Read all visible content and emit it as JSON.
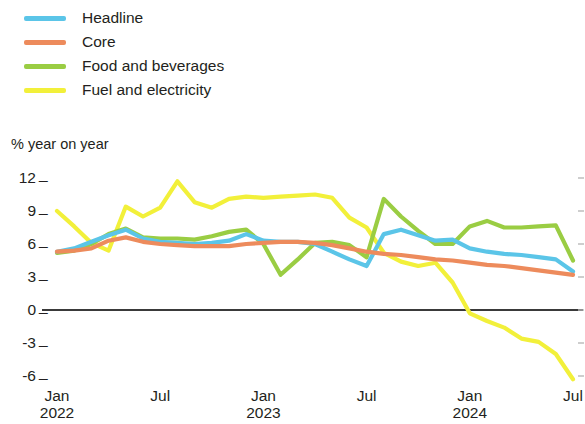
{
  "legend": {
    "items": [
      {
        "label": "Headline",
        "color": "#5BC5E8"
      },
      {
        "label": "Core",
        "color": "#ED8B5C"
      },
      {
        "label": "Food and beverages",
        "color": "#9ACD43"
      },
      {
        "label": "Fuel and electricity",
        "color": "#F2F03A"
      }
    ]
  },
  "axis": {
    "y_title": "% year on year",
    "y_ticks": [
      "12",
      "9",
      "6",
      "3",
      "0",
      "-3",
      "-6"
    ],
    "tick_dash": "_",
    "x_ticks": [
      {
        "month": "Jan",
        "year": "2022"
      },
      {
        "month": "Jul",
        "year": ""
      },
      {
        "month": "Jan",
        "year": "2023"
      },
      {
        "month": "Jul",
        "year": ""
      },
      {
        "month": "Jan",
        "year": "2024"
      },
      {
        "month": "Jul",
        "year": ""
      }
    ]
  },
  "chart_data": {
    "type": "line",
    "title": "",
    "subtitle": "",
    "xlabel": "",
    "ylabel": "% year on year",
    "ylim": [
      -6,
      12
    ],
    "yticks": [
      12,
      9,
      6,
      3,
      0,
      -3,
      -6
    ],
    "grid": false,
    "zero_line": true,
    "legend_position": "top-left",
    "x": [
      "Jan 2022",
      "Feb 2022",
      "Mar 2022",
      "Apr 2022",
      "May 2022",
      "Jun 2022",
      "Jul 2022",
      "Aug 2022",
      "Sep 2022",
      "Oct 2022",
      "Nov 2022",
      "Dec 2022",
      "Jan 2023",
      "Feb 2023",
      "Mar 2023",
      "Apr 2023",
      "May 2023",
      "Jun 2023",
      "Jul 2023",
      "Aug 2023",
      "Sep 2023",
      "Oct 2023",
      "Nov 2023",
      "Dec 2023",
      "Jan 2024",
      "Feb 2024",
      "Mar 2024",
      "Apr 2024",
      "May 2024",
      "Jun 2024",
      "Jul 2024"
    ],
    "xtick_labels": [
      "Jan 2022",
      "Jul",
      "Jan 2023",
      "Jul",
      "Jan 2024",
      "Jul"
    ],
    "series": [
      {
        "name": "Headline",
        "color": "#5BC5E8",
        "values": [
          5.3,
          5.6,
          6.2,
          6.8,
          7.3,
          6.5,
          6.2,
          6.1,
          6.0,
          6.1,
          6.3,
          6.9,
          6.3,
          6.2,
          6.2,
          6.0,
          5.3,
          4.6,
          4.0,
          6.9,
          7.3,
          6.8,
          6.3,
          6.4,
          5.6,
          5.3,
          5.1,
          5.0,
          4.8,
          4.6,
          3.5
        ]
      },
      {
        "name": "Core",
        "color": "#ED8B5C",
        "values": [
          5.3,
          5.4,
          5.6,
          6.3,
          6.6,
          6.2,
          6.0,
          5.9,
          5.8,
          5.8,
          5.8,
          6.0,
          6.1,
          6.2,
          6.2,
          6.1,
          5.9,
          5.6,
          5.3,
          5.1,
          5.0,
          4.8,
          4.6,
          4.5,
          4.3,
          4.1,
          4.0,
          3.8,
          3.6,
          3.4,
          3.2
        ]
      },
      {
        "name": "Food and beverages",
        "color": "#9ACD43",
        "values": [
          5.2,
          5.4,
          6.0,
          6.9,
          7.4,
          6.6,
          6.5,
          6.5,
          6.4,
          6.7,
          7.1,
          7.3,
          6.0,
          3.2,
          4.6,
          6.1,
          6.2,
          5.9,
          4.8,
          10.1,
          8.5,
          7.2,
          6.0,
          6.0,
          7.6,
          8.1,
          7.5,
          7.5,
          7.6,
          7.7,
          4.5
        ]
      },
      {
        "name": "Fuel and electricity",
        "color": "#F2F03A",
        "values": [
          9.0,
          7.6,
          6.1,
          5.4,
          9.4,
          8.5,
          9.3,
          11.7,
          9.8,
          9.3,
          10.1,
          10.3,
          10.2,
          10.3,
          10.4,
          10.5,
          10.2,
          8.4,
          7.5,
          5.2,
          4.4,
          4.0,
          4.3,
          2.5,
          -0.3,
          -1.0,
          -1.6,
          -2.6,
          -2.9,
          -4.0,
          -6.3
        ]
      }
    ]
  },
  "geometry": {
    "plot_left": 57,
    "plot_right": 573,
    "y_for_12": 178,
    "y_for_minus6": 376,
    "zero_line_x1": 42,
    "zero_line_x2": 583,
    "zero_line_y": 310
  }
}
